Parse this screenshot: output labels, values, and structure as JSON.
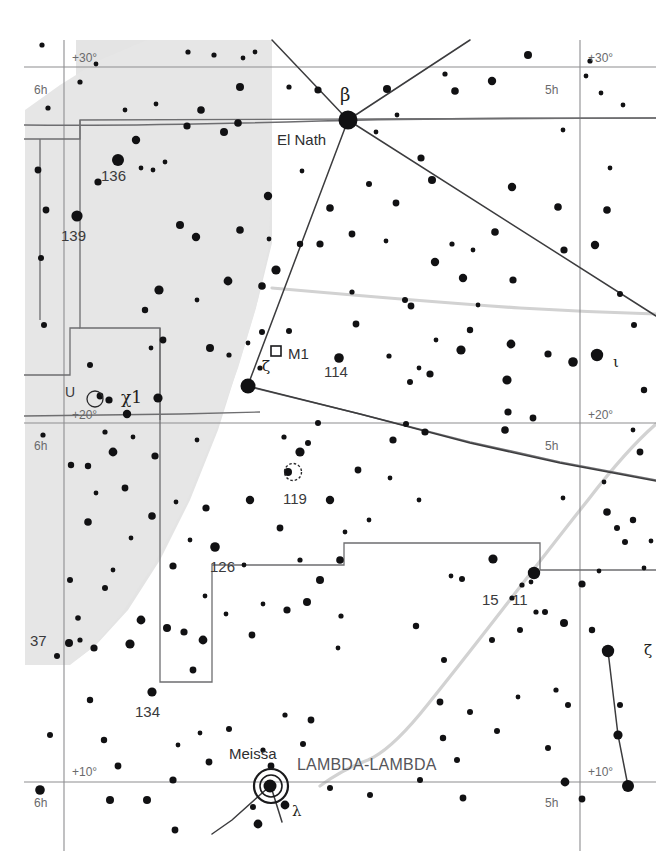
{
  "chart": {
    "type": "star-chart",
    "background_color": "#ffffff",
    "milkyway_fill": "#e4e4e4",
    "grid_color": "#8a8a8c",
    "constellation_boundary_color": "#6e6e70",
    "constellation_line_color": "#3c3c3e",
    "milkyway_edge_color": "#d0d0d0",
    "star_color": "#111113",
    "width": 656,
    "height": 851
  },
  "grid": {
    "ra_lines": [
      {
        "label": "6h",
        "x": 64
      },
      {
        "label": "5h",
        "x": 580
      }
    ],
    "dec_lines": [
      {
        "label": "+30°",
        "y": 67
      },
      {
        "label": "+20°",
        "y": 423
      },
      {
        "label": "+10°",
        "y": 782
      }
    ],
    "corner_labels": {
      "top_left_dec": "+30°",
      "top_left_ra": "6h",
      "top_right_dec": "+30°",
      "top_right_ra": "5h",
      "mid_left_dec": "+20°",
      "mid_left_ra": "6h",
      "mid_right_dec": "+20°",
      "mid_right_ra": "5h",
      "bottom_left_dec": "+10°",
      "bottom_left_ra": "6h",
      "bottom_right_dec": "+10°",
      "bottom_right_ra": "5h"
    }
  },
  "labels": {
    "coord": [
      {
        "text": "+30°",
        "x": 72,
        "y": 52
      },
      {
        "text": "6h",
        "x": 34,
        "y": 84
      },
      {
        "text": "+30°",
        "x": 588,
        "y": 52
      },
      {
        "text": "5h",
        "x": 545,
        "y": 84
      },
      {
        "text": "+20°",
        "x": 72,
        "y": 409
      },
      {
        "text": "6h",
        "x": 34,
        "y": 440
      },
      {
        "text": "+20°",
        "x": 588,
        "y": 409
      },
      {
        "text": "5h",
        "x": 545,
        "y": 440
      },
      {
        "text": "+10°",
        "x": 72,
        "y": 766
      },
      {
        "text": "6h",
        "x": 34,
        "y": 797
      },
      {
        "text": "+10°",
        "x": 588,
        "y": 766
      },
      {
        "text": "5h",
        "x": 545,
        "y": 797
      }
    ],
    "flamsteed": [
      {
        "text": "136",
        "x": 101,
        "y": 168
      },
      {
        "text": "139",
        "x": 61,
        "y": 228
      },
      {
        "text": "37",
        "x": 30,
        "y": 633
      },
      {
        "text": "114",
        "x": 324,
        "y": 364
      },
      {
        "text": "119",
        "x": 283,
        "y": 491
      },
      {
        "text": "126",
        "x": 210,
        "y": 559
      },
      {
        "text": "134",
        "x": 135,
        "y": 704
      },
      {
        "text": "15",
        "x": 482,
        "y": 592
      },
      {
        "text": "11",
        "x": 512,
        "y": 592
      }
    ],
    "greek": [
      {
        "text": "β",
        "x": 340,
        "y": 86,
        "size": "lg"
      },
      {
        "text": "ζ",
        "x": 262,
        "y": 359,
        "size": "sm"
      },
      {
        "text": "ι",
        "x": 613,
        "y": 355,
        "size": "sm"
      },
      {
        "text": "λ",
        "x": 292,
        "y": 804,
        "size": "sm"
      },
      {
        "text": "ζ",
        "x": 644,
        "y": 643,
        "size": "sm"
      }
    ],
    "proper_names": [
      {
        "text": "El Nath",
        "x": 277,
        "y": 132
      },
      {
        "text": "Meissa",
        "x": 229,
        "y": 746
      }
    ],
    "deep_sky": [
      {
        "text": "M1",
        "x": 288,
        "y": 346,
        "marker": "open-square"
      }
    ],
    "variable": [
      {
        "text": "U",
        "x": 65,
        "y": 385,
        "marker": "circled-star"
      }
    ],
    "asterism": [
      {
        "text": "χ1",
        "x": 121,
        "y": 392
      },
      {
        "text": "LAMBDA-LAMBDA",
        "x": 297,
        "y": 757
      }
    ]
  },
  "legend_keys": {
    "open_square": "open-cluster-or-nebula-marker",
    "circled_dot": "variable-star-marker",
    "large_filled_circle": "bright-star",
    "small_filled_circle": "faint-star"
  }
}
